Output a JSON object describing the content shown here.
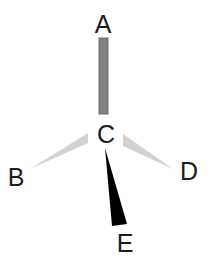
{
  "diagram": {
    "background_color": "#ffffff",
    "center_atom": {
      "label": "C",
      "x": 106,
      "y": 143,
      "text_x": 106,
      "text_y": 143
    },
    "labels": {
      "a": "A",
      "b": "B",
      "c": "C",
      "d": "D",
      "e": "E"
    },
    "label_positions": {
      "a": {
        "x": 103,
        "y": 33
      },
      "b": {
        "x": 16,
        "y": 186
      },
      "c": {
        "x": 106,
        "y": 143
      },
      "d": {
        "x": 189,
        "y": 180
      },
      "e": {
        "x": 125,
        "y": 252
      }
    },
    "bonds": [
      {
        "name": "bond-c-a",
        "from": "C",
        "to": "A",
        "style": "plain-bar",
        "color": "#808080",
        "edge_color": "#6e6e6e",
        "x": 99,
        "y": 38,
        "width": 9,
        "height": 76
      },
      {
        "name": "bond-c-b",
        "from": "C",
        "to": "B",
        "style": "hashed-wedge-light",
        "color": "#d2d2d2",
        "points": "88,133 88,143 30,169"
      },
      {
        "name": "bond-c-d",
        "from": "C",
        "to": "D",
        "style": "hashed-wedge-light",
        "color": "#d2d2d2",
        "points": "123,134 123,146 173,169"
      },
      {
        "name": "bond-c-e",
        "from": "C",
        "to": "E",
        "style": "solid-wedge-bold",
        "color": "#000000",
        "points": "105,148 112,226 127,224"
      }
    ],
    "colors": {
      "background": "#ffffff",
      "label_text": "#1c1c1c",
      "bar_gray": "#808080",
      "wedge_light_gray": "#d2d2d2",
      "wedge_black": "#000000"
    }
  }
}
